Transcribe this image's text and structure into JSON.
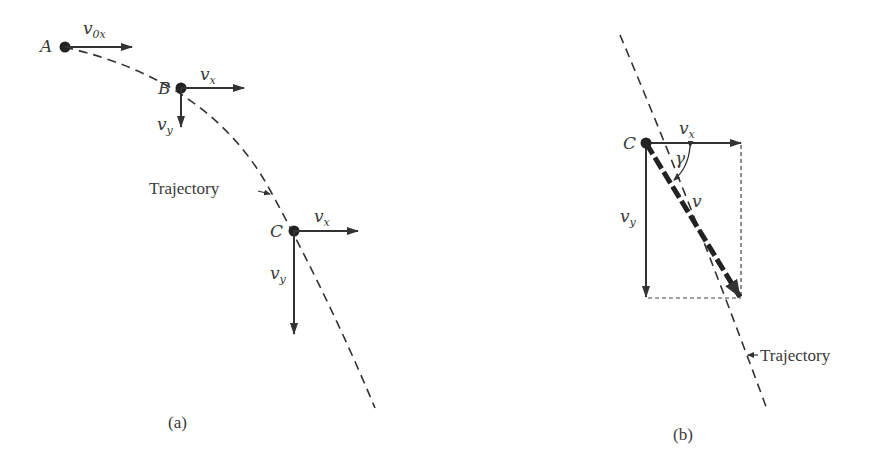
{
  "figure": {
    "panel_a": {
      "caption": "(a)",
      "trajectory_label": "Trajectory",
      "points": [
        {
          "name": "A",
          "vx_label_base": "v",
          "vx_label_sub": "0x"
        },
        {
          "name": "B",
          "vx_label_base": "v",
          "vx_label_sub": "x",
          "vy_label_base": "v",
          "vy_label_sub": "y"
        },
        {
          "name": "C",
          "vx_label_base": "v",
          "vx_label_sub": "x",
          "vy_label_base": "v",
          "vy_label_sub": "y"
        }
      ]
    },
    "panel_b": {
      "caption": "(b)",
      "trajectory_label": "Trajectory",
      "point": "C",
      "vx_label_base": "v",
      "vx_label_sub": "x",
      "vy_label_base": "v",
      "vy_label_sub": "y",
      "v_label": "v",
      "angle_label": "γ"
    },
    "colors": {
      "ink": "#333333",
      "background": "#ffffff"
    }
  }
}
